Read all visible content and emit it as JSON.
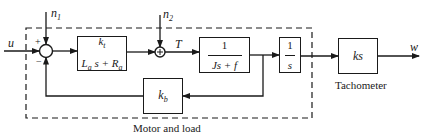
{
  "diagram": {
    "type": "block-diagram",
    "inputs": {
      "u": "u",
      "n1": "n",
      "n1_sub": "1",
      "n2": "n",
      "n2_sub": "2"
    },
    "output": "w",
    "signals": {
      "torque": "T"
    },
    "summing_junction_1": {
      "plus_sign": "+",
      "minus_sign": "−"
    },
    "summing_junction_2": {
      "symbol": "+"
    },
    "blocks": {
      "electrical": {
        "num_k": "k",
        "num_sub": "t",
        "den_L": "L",
        "den_L_sub": "a",
        "den_mid": " s + ",
        "den_R": "R",
        "den_R_sub": "a"
      },
      "mechanical": {
        "num": "1",
        "den": "Js + f"
      },
      "integrator": {
        "num": "1",
        "den": "s"
      },
      "back_emf": {
        "k": "k",
        "sub": "b"
      },
      "tachometer": {
        "tf": "ks"
      }
    },
    "labels": {
      "group": "Motor and load",
      "tachometer": "Tachometer"
    },
    "colors": {
      "line": "#1a1a1a",
      "background": "#ffffff"
    }
  }
}
